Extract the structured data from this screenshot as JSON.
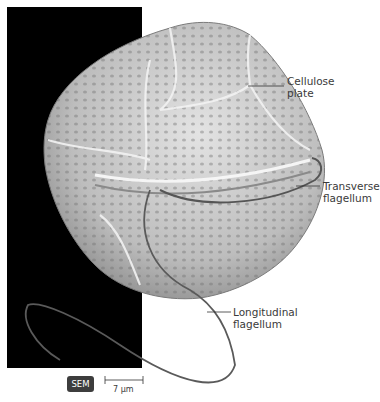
{
  "figure": {
    "labels": {
      "cellulose_plate": "Cellulose\nplate",
      "cellulose_plate_line1": "Cellulose",
      "cellulose_plate_line2": "plate",
      "transverse_line1": "Transverse",
      "transverse_line2": "flagellum",
      "longitudinal_line1": "Longitudinal",
      "longitudinal_line2": "flagellum"
    },
    "badge": "SEM",
    "scale_bar": "7 µm",
    "colors": {
      "background": "#ffffff",
      "panel": "#000000",
      "cell": "#c9c9c9",
      "leader": "#333333",
      "badge": "#3d3d3d"
    }
  }
}
